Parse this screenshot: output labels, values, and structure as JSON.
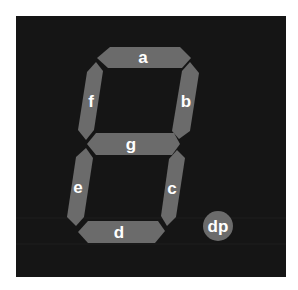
{
  "colors": {
    "panel": "#151515",
    "segment": "#6b6b6b",
    "label": "#ffffff",
    "page": "#ffffff"
  },
  "segments": [
    {
      "id": "a",
      "label": "a"
    },
    {
      "id": "b",
      "label": "b"
    },
    {
      "id": "c",
      "label": "c"
    },
    {
      "id": "d",
      "label": "d"
    },
    {
      "id": "e",
      "label": "e"
    },
    {
      "id": "f",
      "label": "f"
    },
    {
      "id": "g",
      "label": "g"
    }
  ],
  "decimal_point": {
    "id": "dp",
    "label": "dp"
  }
}
